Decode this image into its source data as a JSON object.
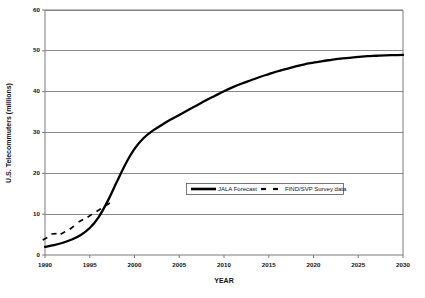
{
  "chart_data": {
    "type": "line",
    "title": "",
    "xlabel": "YEAR",
    "ylabel": "U.S. Telecommuters (millions)",
    "xlim": [
      1990,
      2030
    ],
    "ylim": [
      0,
      60
    ],
    "xticks": [
      1990,
      1995,
      2000,
      2005,
      2010,
      2015,
      2020,
      2025,
      2030
    ],
    "xtick_labels": [
      "1990",
      "1995",
      "2000",
      "2005",
      "2010",
      "2015",
      "2020",
      "2025",
      "2030"
    ],
    "yticks": [
      0,
      10,
      20,
      30,
      40,
      50,
      60
    ],
    "ytick_labels": [
      "0",
      "10",
      "20",
      "30",
      "40",
      "50",
      "60"
    ],
    "grid": "horizontal",
    "legend_position": "center",
    "series": [
      {
        "name": "JALA Forecast",
        "style": "solid",
        "color": "#000000",
        "x": [
          1990,
          1991,
          1992,
          1993,
          1994,
          1995,
          1996,
          1997,
          1998,
          1999,
          2000,
          2001,
          2002,
          2003,
          2004,
          2005,
          2006,
          2007,
          2008,
          2009,
          2010,
          2011,
          2012,
          2013,
          2014,
          2015,
          2016,
          2017,
          2018,
          2019,
          2020,
          2021,
          2022,
          2023,
          2024,
          2025,
          2026,
          2027,
          2028,
          2029,
          2030
        ],
        "values": [
          2.0,
          2.4,
          3.0,
          3.8,
          4.9,
          6.6,
          9.3,
          13.2,
          17.8,
          22.3,
          26.0,
          28.6,
          30.4,
          31.8,
          33.1,
          34.3,
          35.5,
          36.7,
          37.9,
          39.0,
          40.1,
          41.1,
          42.0,
          42.8,
          43.6,
          44.3,
          45.0,
          45.6,
          46.2,
          46.7,
          47.1,
          47.5,
          47.8,
          48.1,
          48.3,
          48.5,
          48.7,
          48.8,
          48.9,
          48.95,
          49.0
        ]
      },
      {
        "name": "FIND/SVP Survey data",
        "style": "dashed",
        "color": "#000000",
        "x": [
          1990,
          1991,
          1992,
          1993,
          1994,
          1995,
          1996,
          1997
        ],
        "values": [
          4.0,
          5.2,
          5.4,
          6.7,
          8.4,
          9.6,
          11.0,
          12.4
        ]
      }
    ]
  },
  "legend": {
    "entries": [
      {
        "label": "JALA Forecast",
        "style": "solid"
      },
      {
        "label": "FIND/SVP Survey data",
        "style": "dashed"
      }
    ]
  }
}
